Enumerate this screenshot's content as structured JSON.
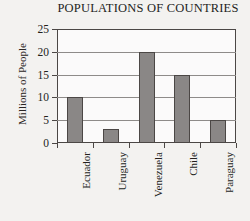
{
  "chart_data": {
    "type": "bar",
    "title": "POPULATIONS OF COUNTRIES",
    "xlabel": "",
    "ylabel": "Millions of People",
    "categories": [
      "Ecuador",
      "Uruguay",
      "Venezuela",
      "Chile",
      "Paraguay"
    ],
    "values": [
      10,
      3,
      20,
      15,
      5
    ],
    "ylim": [
      0,
      25
    ],
    "yticks": [
      0,
      5,
      10,
      15,
      20,
      25
    ],
    "ytick_labels": [
      "0",
      "5",
      "10",
      "15",
      "20",
      "25"
    ],
    "grid": true,
    "legend": false,
    "bar_color": "#8a8786",
    "bar_edge_color": "#4b4745",
    "gridline_color": "#8e8b89",
    "axis_color": "#4b4745",
    "plot_background": "#fbfafa",
    "page_background": "#f3f2f0",
    "text_color": "#231f1d"
  }
}
